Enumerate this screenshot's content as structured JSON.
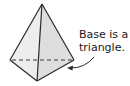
{
  "diagram": {
    "annotation": {
      "line1": "Base is a",
      "line2": "triangle."
    },
    "colors": {
      "face_left": "#ececec",
      "face_right": "#dcdcdc",
      "edge": "#2b2b2b",
      "hidden_edge": "#3a3a3a"
    }
  }
}
